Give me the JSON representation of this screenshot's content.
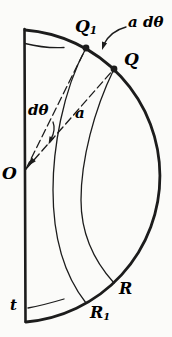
{
  "figure": {
    "background": "#fbfbf9",
    "ink": "#1c1c1c",
    "labels": {
      "q1_main": "Q",
      "q1_sub": "1",
      "arc_element": "a dθ",
      "q": "Q",
      "d_theta": "dθ",
      "radius_a": "a",
      "center_o": "O",
      "thickness_t": "t",
      "r": "R",
      "r1_main": "R",
      "r1_sub": "1"
    }
  }
}
